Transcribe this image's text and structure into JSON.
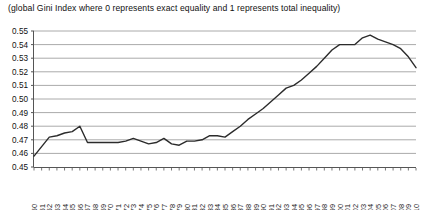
{
  "figure": {
    "subtitle": "(global Gini Index where 0 represents exact equality and 1 represents total inequality)",
    "line_color": "#2b2b2b",
    "grid_color": "#aaaaaa",
    "axis_color": "#555555",
    "background": "#ffffff"
  },
  "chart_data": {
    "type": "line",
    "title": "",
    "subtitle": "(global Gini Index where 0 represents exact equality and 1 represents total inequality)",
    "xlabel": "",
    "ylabel": "",
    "ylim": [
      0.45,
      0.55
    ],
    "ytick_step": 0.01,
    "grid": true,
    "legend": "none",
    "ytick_labels": [
      "0.55",
      "0.54",
      "0.53",
      "0.52",
      "0.51",
      "0.50",
      "0.49",
      "0.48",
      "0.47",
      "0.46",
      "0.45"
    ],
    "ytick_values": [
      0.55,
      0.54,
      0.53,
      0.52,
      0.51,
      0.5,
      0.49,
      0.48,
      0.47,
      0.46,
      0.45
    ],
    "categories": [
      "1960",
      "1961",
      "1962",
      "1963",
      "1964",
      "1965",
      "1966",
      "1967",
      "1968",
      "1969",
      "1970",
      "1971",
      "1972",
      "1973",
      "1974",
      "1975",
      "1976",
      "1977",
      "1978",
      "1979",
      "1980",
      "1981",
      "1982",
      "1983",
      "1984",
      "1985",
      "1986",
      "1987",
      "1988",
      "1989",
      "1990",
      "1991",
      "1992",
      "1993",
      "1994",
      "1995",
      "1996",
      "1997",
      "1998",
      "1999",
      "2000",
      "2001",
      "2002",
      "2003",
      "2004",
      "2005",
      "2006",
      "2007",
      "2008",
      "2009",
      "2010"
    ],
    "series": [
      {
        "name": "Global Gini Index",
        "values": [
          0.458,
          0.465,
          0.472,
          0.473,
          0.475,
          0.476,
          0.48,
          0.468,
          0.468,
          0.468,
          0.468,
          0.468,
          0.469,
          0.471,
          0.469,
          0.467,
          0.468,
          0.471,
          0.467,
          0.466,
          0.469,
          0.469,
          0.47,
          0.473,
          0.473,
          0.472,
          0.476,
          0.48,
          0.485,
          0.489,
          0.493,
          0.498,
          0.503,
          0.508,
          0.51,
          0.514,
          0.519,
          0.524,
          0.53,
          0.536,
          0.54,
          0.54,
          0.54,
          0.545,
          0.547,
          0.544,
          0.542,
          0.54,
          0.537,
          0.531,
          0.523
        ]
      }
    ]
  }
}
